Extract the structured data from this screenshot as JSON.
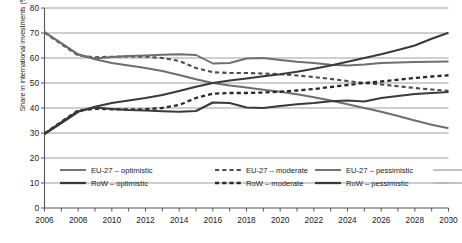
{
  "chart_data": {
    "type": "line",
    "title": "",
    "xlabel": "",
    "ylabel": "Share in international investments (%)",
    "xlim": [
      2006,
      2030
    ],
    "ylim": [
      0,
      80
    ],
    "ytick_step": 10,
    "xtick_step": 1,
    "xlabel_step": 2,
    "grid": "horizontal",
    "legend_position": "below-axes",
    "x": [
      2006,
      2007,
      2008,
      2009,
      2010,
      2011,
      2012,
      2013,
      2014,
      2015,
      2016,
      2017,
      2018,
      2019,
      2020,
      2021,
      2022,
      2023,
      2024,
      2025,
      2026,
      2027,
      2028,
      2029,
      2030
    ],
    "yticks": [
      0,
      10,
      20,
      30,
      40,
      50,
      60,
      70,
      80
    ],
    "xticklabels": [
      "2006",
      "2008",
      "2010",
      "2012",
      "2014",
      "2016",
      "2018",
      "2020",
      "2022",
      "2024",
      "2026",
      "2028",
      "2030"
    ],
    "series": [
      {
        "name": "EU-27 – optimistic",
        "style": "solid",
        "color": "#6e6e6e",
        "width": 1.9,
        "values": [
          70.3,
          66.0,
          61.5,
          59.5,
          58.0,
          57.0,
          56.0,
          54.8,
          53.2,
          51.5,
          50.0,
          49.0,
          48.2,
          47.3,
          46.5,
          45.5,
          44.3,
          43.0,
          41.5,
          40.0,
          38.5,
          36.8,
          35.0,
          33.3,
          31.9
        ]
      },
      {
        "name": "EU-27 – moderate",
        "style": "dashed",
        "color": "#4d4d4d",
        "width": 2.1,
        "values": [
          70.2,
          65.5,
          61.0,
          60.3,
          60.5,
          60.6,
          60.5,
          60.0,
          58.8,
          56.0,
          54.3,
          54.0,
          54.0,
          53.8,
          53.5,
          53.0,
          52.4,
          51.6,
          50.8,
          50.0,
          49.4,
          48.7,
          48.0,
          47.4,
          46.9
        ]
      },
      {
        "name": "EU-27 – pessimistic",
        "style": "solid",
        "color": "#6e6e6e",
        "width": 1.9,
        "values": [
          70.4,
          65.8,
          61.3,
          59.8,
          60.4,
          60.8,
          61.0,
          61.3,
          61.5,
          61.2,
          57.8,
          58.0,
          59.8,
          60.0,
          59.2,
          58.5,
          58.0,
          57.3,
          57.0,
          57.4,
          58.0,
          58.2,
          58.4,
          58.5,
          58.6
        ]
      },
      {
        "name": "RoW – optimistic",
        "style": "solid",
        "color": "#3a3a3a",
        "width": 2.2,
        "values": [
          29.7,
          34.0,
          38.5,
          40.5,
          42.0,
          43.0,
          44.0,
          45.2,
          46.8,
          48.5,
          50.0,
          51.0,
          51.8,
          52.7,
          53.5,
          54.5,
          55.7,
          57.0,
          58.5,
          60.0,
          61.5,
          63.2,
          65.0,
          67.7,
          70.1
        ]
      },
      {
        "name": "RoW – moderate",
        "style": "dashed",
        "color": "#2b2b2b",
        "width": 2.3,
        "values": [
          29.8,
          34.5,
          39.0,
          39.7,
          39.5,
          39.4,
          39.5,
          40.0,
          41.2,
          44.0,
          45.7,
          46.0,
          46.0,
          46.2,
          46.5,
          47.0,
          47.6,
          48.4,
          49.2,
          50.0,
          50.6,
          51.3,
          52.0,
          52.6,
          53.1
        ]
      },
      {
        "name": "RoW – pessimistic",
        "style": "solid",
        "color": "#3a3a3a",
        "width": 2.2,
        "values": [
          29.6,
          34.2,
          38.7,
          40.2,
          39.6,
          39.2,
          39.0,
          38.7,
          38.5,
          38.8,
          42.2,
          42.0,
          40.2,
          40.0,
          40.8,
          41.5,
          42.0,
          42.7,
          43.0,
          42.6,
          44.0,
          44.8,
          45.6,
          46.0,
          46.4
        ]
      }
    ]
  },
  "legend": {
    "entries": [
      {
        "label": "EU-27 – optimistic",
        "style": "solid",
        "color": "#6e6e6e"
      },
      {
        "label": "EU-27 – moderate",
        "style": "dashed",
        "color": "#4d4d4d"
      },
      {
        "label": "EU-27 – pessimistic",
        "style": "solid",
        "color": "#6e6e6e"
      },
      {
        "label": "RoW – optimistic",
        "style": "solid",
        "color": "#3a3a3a"
      },
      {
        "label": "RoW – moderate",
        "style": "dashed",
        "color": "#2b2b2b"
      },
      {
        "label": "RoW – pessimistic",
        "style": "solid",
        "color": "#3a3a3a"
      }
    ]
  },
  "axes": {
    "y_axis_title": "Share in international investments (%)",
    "grid_color": "#777777",
    "axis_color": "#555555"
  }
}
